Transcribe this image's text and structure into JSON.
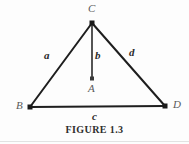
{
  "figure": {
    "caption": "FIGURE 1.3",
    "background_color": "#fdfdfd",
    "stroke_color": "#1e1e1e",
    "vertex_label_color": "#5a5a5a",
    "side_label_color": "#2b2b2b"
  },
  "vertices": [
    {
      "name": "C",
      "label": "C",
      "x": 92,
      "y": 23
    },
    {
      "name": "B",
      "label": "B",
      "x": 30,
      "y": 107
    },
    {
      "name": "D",
      "label": "D",
      "x": 165,
      "y": 106
    },
    {
      "name": "A",
      "label": "A",
      "x": 92,
      "y": 79
    }
  ],
  "segments": [
    {
      "name": "side-a",
      "label": "a",
      "from": "B",
      "to": "C"
    },
    {
      "name": "side-d",
      "label": "d",
      "from": "C",
      "to": "D"
    },
    {
      "name": "side-c",
      "label": "c",
      "from": "B",
      "to": "D"
    },
    {
      "name": "side-b",
      "label": "b",
      "from": "C",
      "to": "A"
    }
  ],
  "labels": {
    "C": "C",
    "B": "B",
    "D": "D",
    "A": "A",
    "a": "a",
    "b": "b",
    "c": "c",
    "d": "d"
  }
}
